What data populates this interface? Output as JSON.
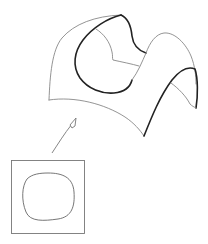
{
  "figure": {
    "elements": [
      {
        "name": "surface-patch",
        "kind": "3d-surface"
      },
      {
        "name": "mapping-arrow",
        "kind": "arrow"
      },
      {
        "name": "parameter-domain",
        "kind": "square"
      },
      {
        "name": "domain-curve",
        "kind": "closed-curve"
      }
    ],
    "colors": {
      "thin_line": "#777777",
      "bold_line": "#222222",
      "background": "#ffffff"
    }
  }
}
